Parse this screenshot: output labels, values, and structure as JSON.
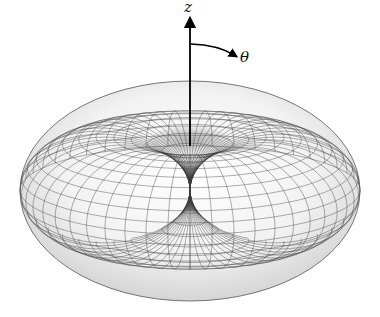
{
  "figure": {
    "title": "",
    "shape": "torus",
    "mesh": {
      "meridians": 48,
      "parallels": 30
    },
    "colors": {
      "background": "#ffffff",
      "surface_light": "#f7f7f7",
      "surface_shadow": "#c8c8c8",
      "mesh_line": "#3a3a3a",
      "axis": "#000000"
    }
  },
  "axes": {
    "z": {
      "label": "z"
    },
    "theta": {
      "label": "θ"
    }
  }
}
